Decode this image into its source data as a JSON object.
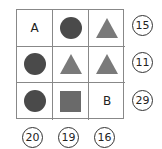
{
  "colors": {
    "circle": "#4a4a4a",
    "triangle": "#7a7a7a",
    "square": "#6a6a6a"
  },
  "grid": [
    [
      {
        "type": "letter",
        "value": "A"
      },
      {
        "type": "circle"
      },
      {
        "type": "triangle"
      }
    ],
    [
      {
        "type": "circle"
      },
      {
        "type": "triangle"
      },
      {
        "type": "triangle"
      }
    ],
    [
      {
        "type": "circle"
      },
      {
        "type": "square"
      },
      {
        "type": "letter",
        "value": "B"
      }
    ]
  ],
  "row_sums": [
    "15",
    "11",
    "29"
  ],
  "column_sums": [
    "20",
    "19",
    "16"
  ]
}
